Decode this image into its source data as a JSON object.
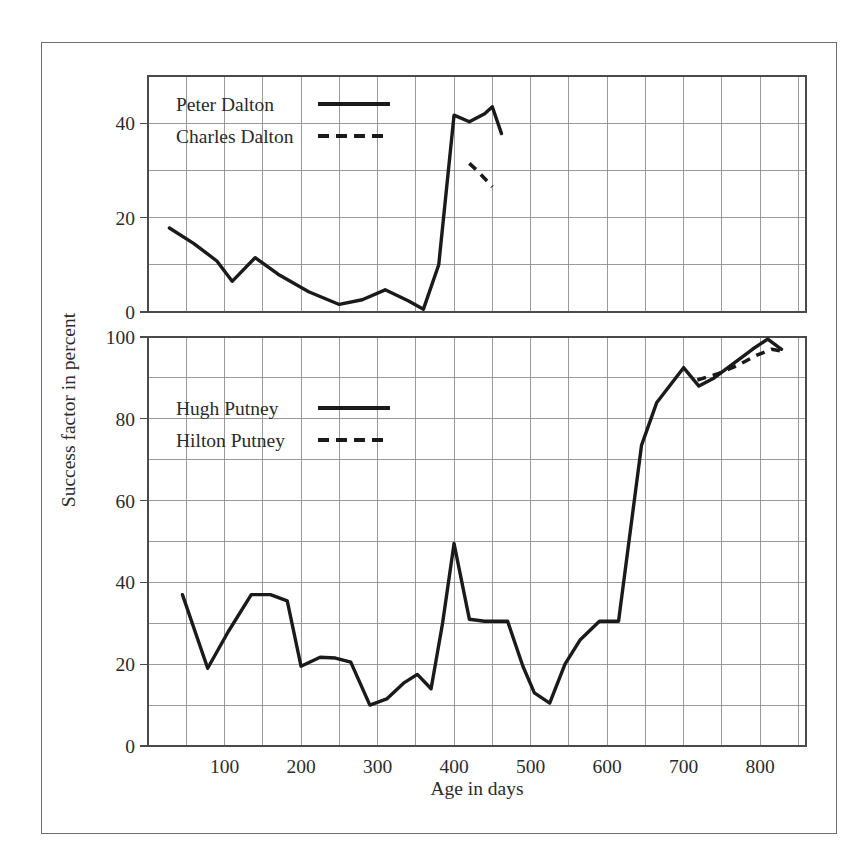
{
  "figure": {
    "xlabel": "Age in days",
    "ylabel": "Success factor in percent"
  },
  "chart_data": [
    {
      "id": "upper",
      "type": "line",
      "title": "",
      "xlabel": "Age in days",
      "ylabel": "Success factor in percent",
      "xlim": [
        0,
        860
      ],
      "ylim": [
        0,
        50
      ],
      "xticks": [
        100,
        200,
        300,
        400,
        500,
        600,
        700,
        800
      ],
      "xtick_labels": [
        "100",
        "200",
        "300",
        "400",
        "500",
        "600",
        "700",
        "800"
      ],
      "yticks": [
        0,
        20,
        40
      ],
      "ytick_labels": [
        "0",
        "20",
        "40"
      ],
      "xgrid_step": 50,
      "ygrid_step": 10,
      "grid": true,
      "legend_position": "top-left-inside",
      "series": [
        {
          "name": "Peter Dalton",
          "style": "solid",
          "x": [
            28,
            60,
            90,
            110,
            140,
            170,
            210,
            250,
            280,
            310,
            340,
            360,
            380,
            400,
            420,
            440,
            450,
            462
          ],
          "y": [
            17.8,
            14.5,
            10.8,
            6.5,
            11.5,
            8.0,
            4.3,
            1.6,
            2.6,
            4.7,
            2.4,
            0.6,
            10.0,
            41.7,
            40.3,
            42.0,
            43.5,
            37.8
          ]
        },
        {
          "name": "Charles Dalton",
          "style": "dashed",
          "x": [
            420,
            430,
            440,
            450
          ],
          "y": [
            31.5,
            30.0,
            28.3,
            26.5
          ]
        }
      ]
    },
    {
      "id": "lower",
      "type": "line",
      "title": "",
      "xlabel": "Age in days",
      "ylabel": "Success factor in percent",
      "xlim": [
        0,
        860
      ],
      "ylim": [
        0,
        100
      ],
      "xticks": [
        100,
        200,
        300,
        400,
        500,
        600,
        700,
        800
      ],
      "xtick_labels": [
        "100",
        "200",
        "300",
        "400",
        "500",
        "600",
        "700",
        "800"
      ],
      "yticks": [
        0,
        20,
        40,
        60,
        80,
        100
      ],
      "ytick_labels": [
        "0",
        "20",
        "40",
        "60",
        "80",
        "100"
      ],
      "xgrid_step": 50,
      "ygrid_step": 10,
      "grid": true,
      "legend_position": "upper-left-inside",
      "series": [
        {
          "name": "Hugh Putney",
          "style": "solid",
          "x": [
            45,
            78,
            105,
            135,
            160,
            182,
            200,
            225,
            245,
            265,
            290,
            312,
            335,
            352,
            370,
            385,
            400,
            420,
            440,
            470,
            490,
            505,
            525,
            545,
            565,
            590,
            615,
            645,
            665,
            700,
            720,
            740,
            765,
            790,
            810,
            828
          ],
          "y": [
            37.0,
            19.0,
            28.0,
            37.0,
            37.0,
            35.5,
            19.5,
            21.7,
            21.5,
            20.5,
            10.0,
            11.5,
            15.5,
            17.5,
            14.0,
            30.0,
            49.5,
            31.0,
            30.5,
            30.5,
            19.5,
            13.0,
            10.5,
            20.0,
            26.0,
            30.5,
            30.5,
            73.5,
            84.0,
            92.5,
            88.0,
            90.0,
            93.5,
            97.0,
            99.5,
            97.0
          ]
        },
        {
          "name": "Hilton Putney",
          "style": "dashed",
          "x": [
            718,
            745,
            770,
            795,
            815,
            830
          ],
          "y": [
            89.5,
            91.0,
            93.0,
            95.5,
            97.0,
            96.5
          ]
        }
      ]
    }
  ],
  "upper_legend": {
    "entries": [
      {
        "label": "Peter Dalton",
        "style": "solid"
      },
      {
        "label": "Charles Dalton",
        "style": "dashed"
      }
    ]
  },
  "lower_legend": {
    "entries": [
      {
        "label": "Hugh Putney",
        "style": "solid"
      },
      {
        "label": "Hilton Putney",
        "style": "dashed"
      }
    ]
  }
}
